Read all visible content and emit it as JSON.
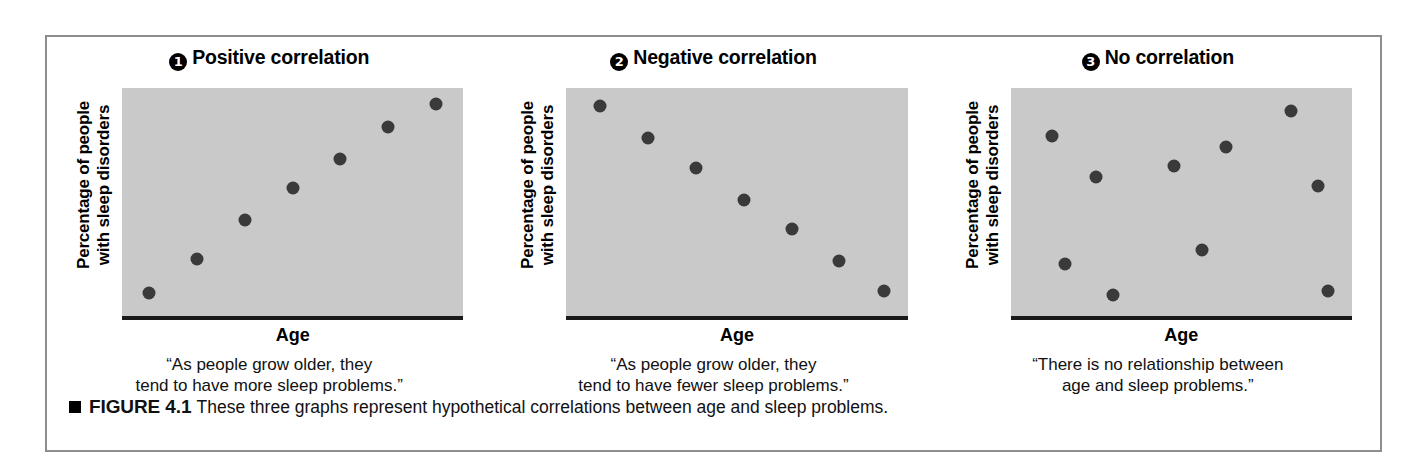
{
  "figure": {
    "caption_marker": "square-bullet",
    "caption_label": "FIGURE 4.1",
    "caption_text": "These three graphs represent hypothetical correlations between age and sleep problems."
  },
  "colors": {
    "plot_background": "#c9c9c9",
    "dot": "#3a3a3a",
    "axis": "#1a1a1a",
    "frame_border": "#8d8d8d",
    "page_background": "#ffffff"
  },
  "panels": [
    {
      "number": "1",
      "title": "Positive correlation",
      "ylabel_line1": "Percentage of people",
      "ylabel_line2": "with sleep disorders",
      "xlabel": "Age",
      "quote_line1": "“As people grow older, they",
      "quote_line2": "tend to have more sleep problems.”"
    },
    {
      "number": "2",
      "title": "Negative correlation",
      "ylabel_line1": "Percentage of people",
      "ylabel_line2": "with sleep disorders",
      "xlabel": "Age",
      "quote_line1": "“As people grow older, they",
      "quote_line2": "tend to have fewer sleep problems.”"
    },
    {
      "number": "3",
      "title": "No correlation",
      "ylabel_line1": "Percentage of people",
      "ylabel_line2": "with sleep disorders",
      "xlabel": "Age",
      "quote_line1": "“There is no relationship between",
      "quote_line2": "age and sleep problems.”"
    }
  ],
  "chart_data": [
    {
      "type": "scatter",
      "title": "Positive correlation",
      "xlabel": "Age",
      "ylabel": "Percentage of people with sleep disorders",
      "xlim": [
        0,
        100
      ],
      "ylim": [
        0,
        100
      ],
      "grid": false,
      "legend": "none",
      "annotation": "“As people grow older, they tend to have more sleep problems.”",
      "points": [
        {
          "x": 8,
          "y": 10
        },
        {
          "x": 22,
          "y": 25
        },
        {
          "x": 36,
          "y": 42
        },
        {
          "x": 50,
          "y": 56
        },
        {
          "x": 64,
          "y": 69
        },
        {
          "x": 78,
          "y": 83
        },
        {
          "x": 92,
          "y": 93
        }
      ]
    },
    {
      "type": "scatter",
      "title": "Negative correlation",
      "xlabel": "Age",
      "ylabel": "Percentage of people with sleep disorders",
      "xlim": [
        0,
        100
      ],
      "ylim": [
        0,
        100
      ],
      "grid": false,
      "legend": "none",
      "annotation": "“As people grow older, they tend to have fewer sleep problems.”",
      "points": [
        {
          "x": 10,
          "y": 92
        },
        {
          "x": 24,
          "y": 78
        },
        {
          "x": 38,
          "y": 65
        },
        {
          "x": 52,
          "y": 51
        },
        {
          "x": 66,
          "y": 38
        },
        {
          "x": 80,
          "y": 24
        },
        {
          "x": 93,
          "y": 11
        }
      ]
    },
    {
      "type": "scatter",
      "title": "No correlation",
      "xlabel": "Age",
      "ylabel": "Percentage of people with sleep disorders",
      "xlim": [
        0,
        100
      ],
      "ylim": [
        0,
        100
      ],
      "grid": false,
      "legend": "none",
      "annotation": "“There is no relationship between age and sleep problems.”",
      "points": [
        {
          "x": 12,
          "y": 79
        },
        {
          "x": 25,
          "y": 61
        },
        {
          "x": 16,
          "y": 23
        },
        {
          "x": 30,
          "y": 9
        },
        {
          "x": 48,
          "y": 66
        },
        {
          "x": 56,
          "y": 29
        },
        {
          "x": 63,
          "y": 74
        },
        {
          "x": 82,
          "y": 90
        },
        {
          "x": 90,
          "y": 57
        },
        {
          "x": 93,
          "y": 11
        }
      ]
    }
  ]
}
